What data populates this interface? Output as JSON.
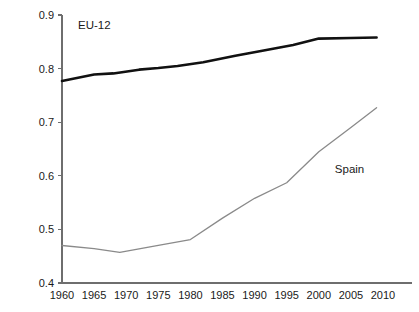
{
  "chart_data": {
    "type": "line",
    "title": "",
    "subtitle": "",
    "xlabel": "",
    "ylabel": "",
    "x": [
      1960,
      1965,
      1970,
      1975,
      1980,
      1985,
      1990,
      1995,
      2000,
      2005,
      2010
    ],
    "xlim": [
      1960,
      2010
    ],
    "ylim": [
      0.4,
      0.9
    ],
    "xticks": [
      1960,
      1965,
      1970,
      1975,
      1980,
      1985,
      1990,
      1995,
      2000,
      2005,
      2010
    ],
    "xtick_labels": [
      "1960",
      "1965",
      "1970",
      "1975",
      "1980",
      "1985",
      "1990",
      "1995",
      "2000",
      "2005",
      "2010"
    ],
    "yticks": [
      0.4,
      0.5,
      0.6,
      0.7,
      0.8,
      0.9
    ],
    "ytick_labels": [
      "0.4",
      "0.5",
      "0.6",
      "0.7",
      "0.8",
      "0.9"
    ],
    "grid": false,
    "legend": "inline-annotations",
    "series": [
      {
        "name": "EU-12",
        "color": "#111111",
        "width": 2.6,
        "label_x": 1962.5,
        "label_y": 0.873,
        "x": [
          1960,
          1965,
          1968,
          1972,
          1975,
          1978,
          1982,
          1987,
          1991,
          1996,
          2000,
          2005,
          2009
        ],
        "values": [
          0.777,
          0.789,
          0.791,
          0.798,
          0.801,
          0.805,
          0.812,
          0.824,
          0.833,
          0.844,
          0.856,
          0.857,
          0.858
        ]
      },
      {
        "name": "Spain",
        "color": "#8a8a8a",
        "width": 1.3,
        "label_x": 2002.5,
        "label_y": 0.605,
        "x": [
          1960,
          1965,
          1969,
          1975,
          1980,
          1985,
          1990,
          1995,
          2000,
          2005,
          2009
        ],
        "values": [
          0.47,
          0.464,
          0.457,
          0.47,
          0.481,
          0.521,
          0.558,
          0.587,
          0.645,
          0.69,
          0.727
        ]
      }
    ]
  },
  "annotations": {
    "eu12_label": "EU-12",
    "spain_label": "Spain"
  }
}
